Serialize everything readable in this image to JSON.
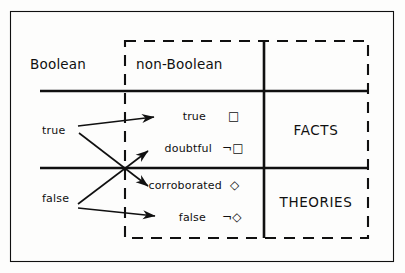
{
  "figure": {
    "colors": {
      "ink": "#101010",
      "paper": "#fdfdfc"
    },
    "columns": {
      "boolean_label": "Boolean",
      "non_boolean_label": "non-Boolean"
    },
    "rows": {
      "facts_label": "FACTS",
      "theories_label": "THEORIES"
    },
    "boolean_values": {
      "true_label": "true",
      "false_label": "false"
    },
    "non_boolean_entries": [
      {
        "label": "true",
        "symbol": "□"
      },
      {
        "label": "doubtful",
        "symbol": "¬□"
      },
      {
        "label": "corroborated",
        "symbol": "◇"
      },
      {
        "label": "false",
        "symbol": "¬◇"
      }
    ],
    "mappings": [
      {
        "from": "true",
        "to": "true"
      },
      {
        "from": "true",
        "to": "corroborated"
      },
      {
        "from": "false",
        "to": "doubtful"
      },
      {
        "from": "false",
        "to": "false"
      }
    ]
  }
}
